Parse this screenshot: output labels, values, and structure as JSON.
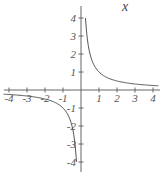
{
  "chart_data": {
    "type": "line",
    "title": "",
    "function": "y = 1/x",
    "xlabel": "x",
    "ylabel": "",
    "xlim": [
      -4,
      4
    ],
    "ylim": [
      -4,
      4
    ],
    "grid": false,
    "x_ticks": [
      -4,
      -3,
      -2,
      -1,
      1,
      2,
      3,
      4
    ],
    "y_ticks": [
      -4,
      -3,
      -2,
      -1,
      1,
      2,
      3,
      4
    ],
    "x_tick_labels": [
      "-4",
      "-3",
      "-2",
      "-1",
      "1",
      "2",
      "3",
      "4"
    ],
    "y_tick_labels": [
      "-4",
      "-3",
      "-2",
      "-1",
      "1",
      "2",
      "3",
      "4"
    ],
    "series": [
      {
        "name": "y = 1/x (x>0)",
        "x": [
          0.25,
          0.3,
          0.4,
          0.5,
          0.75,
          1,
          1.5,
          2,
          3,
          4
        ],
        "y": [
          4,
          3.33,
          2.5,
          2,
          1.33,
          1,
          0.67,
          0.5,
          0.33,
          0.25
        ]
      },
      {
        "name": "y = 1/x (x<0)",
        "x": [
          -4,
          -3,
          -2,
          -1.5,
          -1,
          -0.75,
          -0.5,
          -0.4,
          -0.3,
          -0.25
        ],
        "y": [
          -0.25,
          -0.33,
          -0.5,
          -0.67,
          -1,
          -1.33,
          -2,
          -2.5,
          -3.33,
          -4
        ]
      }
    ],
    "colors": {
      "axis": "#666666",
      "curve": "#555555"
    }
  }
}
